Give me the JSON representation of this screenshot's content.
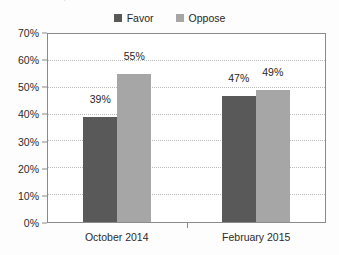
{
  "source_caption": "Research Center, 2015",
  "legend": {
    "position": "top-center",
    "items": [
      {
        "label": "Favor",
        "color": "#595959",
        "icon": "legend-swatch-icon"
      },
      {
        "label": "Oppose",
        "color": "#a6a6a6",
        "icon": "legend-swatch-icon"
      }
    ]
  },
  "chart_data": {
    "type": "bar",
    "title": "",
    "xlabel": "",
    "ylabel": "",
    "categories": [
      "October 2014",
      "February 2015"
    ],
    "series": [
      {
        "name": "Favor",
        "color": "#595959",
        "values": [
          39,
          47
        ],
        "labels": [
          "39%",
          "49%"
        ]
      },
      {
        "name": "Oppose",
        "color": "#a6a6a6",
        "values": [
          55,
          49
        ],
        "labels": [
          "55%",
          "49%"
        ]
      }
    ],
    "value_labels": {
      "October 2014": {
        "Favor": "39%",
        "Oppose": "55%"
      },
      "February 2015": {
        "Favor": "47%",
        "Oppose": "49%"
      }
    },
    "ylim": [
      0,
      70
    ],
    "ytick_step": 10,
    "ytick_labels": [
      "0%",
      "10%",
      "20%",
      "30%",
      "40%",
      "50%",
      "60%",
      "70%"
    ],
    "ytick_values": [
      0,
      10,
      20,
      30,
      40,
      50,
      60,
      70
    ],
    "grid": true,
    "grid_style": "dotted",
    "legend_position": "top-center"
  },
  "colors": {
    "favor": "#595959",
    "oppose": "#a6a6a6",
    "axis": "#8a8a8a",
    "grid": "#b9b9b9",
    "text": "#2b2b2b",
    "plot_background": "#ffffff"
  }
}
